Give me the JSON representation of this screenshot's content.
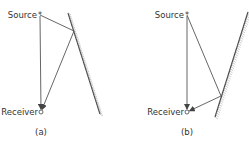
{
  "panels": [
    {
      "id": "a",
      "caption": "(a)",
      "source_label": "Source",
      "receiver_label": "Receiver",
      "source": {
        "x": 40,
        "y": 15
      },
      "receiver": {
        "x": 41,
        "y": 112
      },
      "reflection_point": {
        "x": 74,
        "y": 31
      },
      "wall": {
        "x1": 68,
        "y1": 13,
        "x2": 100,
        "y2": 114
      },
      "hatch_side": "right"
    },
    {
      "id": "b",
      "caption": "(b)",
      "source_label": "Source",
      "receiver_label": "Receiver",
      "source": {
        "x": 187,
        "y": 15
      },
      "receiver": {
        "x": 187,
        "y": 112
      },
      "reflection_point": {
        "x": 221,
        "y": 96
      },
      "wall": {
        "x1": 248,
        "y1": 12,
        "x2": 215,
        "y2": 117
      },
      "hatch_side": "right"
    }
  ],
  "colors": {
    "line": "#555555",
    "wall": "#444444",
    "hatch": "#aaaaaa",
    "text": "#333333"
  }
}
